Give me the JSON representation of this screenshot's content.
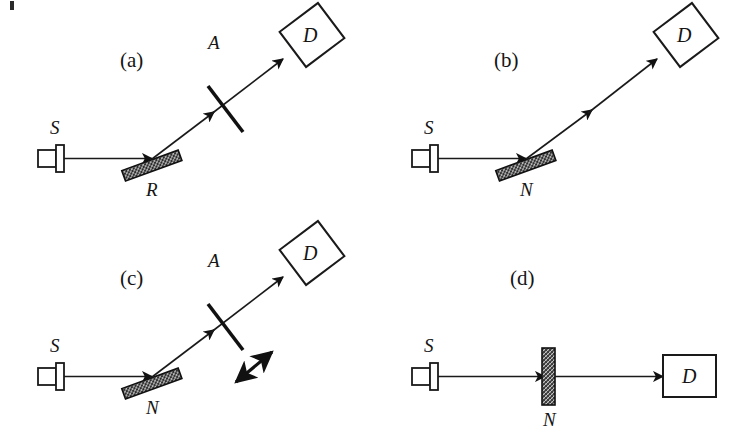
{
  "figure": {
    "background_color": "#ffffff",
    "ink_color": "#1a1a1a",
    "panels": [
      {
        "id": "a",
        "label": "(a)",
        "source_label": "S",
        "optic_label": "R",
        "analyzer_label": "A",
        "detector_label": "D",
        "has_analyzer": true,
        "has_double_arrow": false,
        "geometry": "reflection"
      },
      {
        "id": "b",
        "label": "(b)",
        "source_label": "S",
        "optic_label": "N",
        "analyzer_label": "",
        "detector_label": "D",
        "has_analyzer": false,
        "has_double_arrow": false,
        "geometry": "reflection"
      },
      {
        "id": "c",
        "label": "(c)",
        "source_label": "S",
        "optic_label": "N",
        "analyzer_label": "A",
        "detector_label": "D",
        "has_analyzer": true,
        "has_double_arrow": true,
        "geometry": "reflection"
      },
      {
        "id": "d",
        "label": "(d)",
        "source_label": "S",
        "optic_label": "N",
        "analyzer_label": "",
        "detector_label": "D",
        "has_analyzer": false,
        "has_double_arrow": false,
        "geometry": "transmission"
      }
    ]
  }
}
